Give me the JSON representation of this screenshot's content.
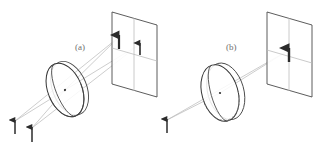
{
  "figure": {
    "width": 322,
    "height": 150,
    "background": "#ffffff"
  },
  "colors": {
    "outline": "#3a3a3a",
    "ray": "#b0b0b0",
    "screen_edge": "#4a4a4a",
    "screen_axis": "#b8b8b8",
    "arrow_dark": "#2b2b2b",
    "label_gray": "#6f6f6f",
    "lens_rim": "#555555",
    "dashed": "#777777"
  },
  "panels": [
    {
      "id": "a",
      "label": "(a)",
      "label_x": 75,
      "label_y": 50,
      "description": "Two object arrows off-axis imaged through tilted lens onto screen producing two image arrows",
      "objects": [
        {
          "name": "object-arrow-1",
          "x": 15,
          "base_y": 134,
          "tip_y": 121
        },
        {
          "name": "object-arrow-2",
          "x": 32,
          "base_y": 142,
          "tip_y": 128
        }
      ],
      "lens": {
        "name": "lens-a",
        "cx": 65,
        "cy": 90,
        "rx": 17,
        "ry": 28,
        "rotation": -22,
        "thickness": 6,
        "has_dashed_equator": false
      },
      "screen": {
        "name": "screen-a",
        "corners": "112,12 157,25 157,97 112,84",
        "h_axis_y_left": 48,
        "h_axis_y_right": 61,
        "v_axis_x": 134
      },
      "images": [
        {
          "name": "image-arrow-1",
          "x": 119,
          "base_y": 49,
          "tip_y": 36
        },
        {
          "name": "image-arrow-2",
          "x": 140,
          "base_y": 55,
          "tip_y": 43
        }
      ],
      "rays": [
        {
          "from": [
            15,
            121
          ],
          "to": [
            119,
            36
          ]
        },
        {
          "from": [
            32,
            128
          ],
          "to": [
            140,
            43
          ]
        },
        {
          "from": [
            15,
            121
          ],
          "to": [
            65,
            90
          ]
        },
        {
          "from": [
            32,
            128
          ],
          "to": [
            65,
            90
          ]
        },
        {
          "from": [
            65,
            90
          ],
          "to": [
            119,
            36
          ]
        },
        {
          "from": [
            65,
            90
          ],
          "to": [
            140,
            43
          ]
        }
      ]
    },
    {
      "id": "b",
      "label": "(b)",
      "label_x": 226,
      "label_y": 50,
      "description": "Single on-axis object arrow imaged through lens onto centre of screen",
      "objects": [
        {
          "name": "object-arrow-1",
          "x": 167,
          "base_y": 133,
          "tip_y": 120
        }
      ],
      "lens": {
        "name": "lens-b",
        "cx": 220,
        "cy": 93,
        "rx": 18,
        "ry": 29,
        "rotation": -16,
        "thickness": 7,
        "has_dashed_equator": true
      },
      "screen": {
        "name": "screen-b",
        "corners": "267,12 312,25 312,97 267,84",
        "h_axis_y_left": 50,
        "h_axis_y_right": 63,
        "v_axis_x": 289
      },
      "images": [
        {
          "name": "image-arrow-1",
          "x": 289,
          "base_y": 62,
          "tip_y": 49
        }
      ],
      "rays": [
        {
          "from": [
            167,
            120
          ],
          "to": [
            289,
            49
          ]
        }
      ]
    }
  ]
}
